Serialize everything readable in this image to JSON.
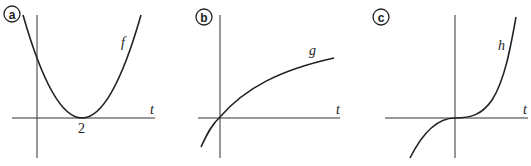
{
  "panels": [
    {
      "badge": "a",
      "function_label": "f",
      "axis_label": "t",
      "tick_label": "2",
      "description": "Parabola with minimum touching t-axis at t=2, positive y-intercept"
    },
    {
      "badge": "b",
      "function_label": "g",
      "axis_label": "t",
      "description": "Increasing concave-down curve passing through origin"
    },
    {
      "badge": "c",
      "function_label": "h",
      "axis_label": "t",
      "description": "Cubic-like curve with inflection point at origin"
    }
  ]
}
